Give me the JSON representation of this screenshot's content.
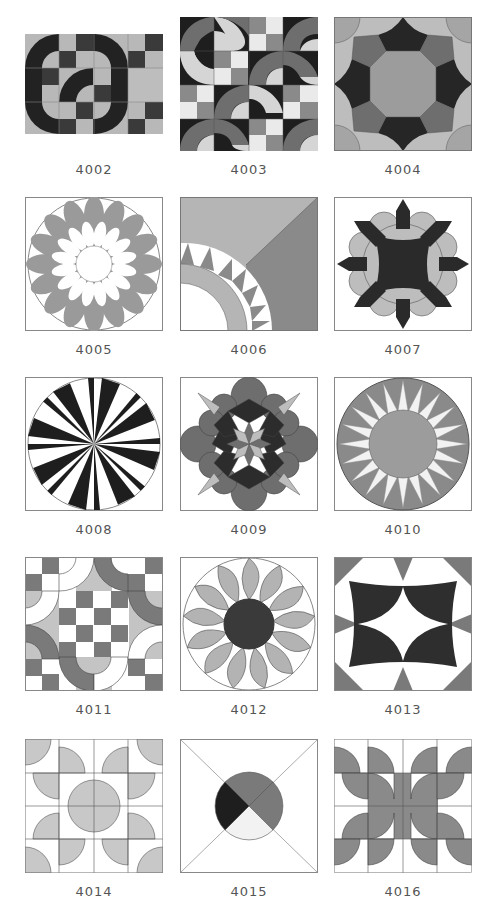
{
  "colors": {
    "black": "#222222",
    "dark": "#3a3a3a",
    "mid": "#7d7d7d",
    "gray": "#9a9a9a",
    "light": "#bdbdbd",
    "pale": "#e6e6e6",
    "white": "#ffffff",
    "outline": "#6a6a6a"
  },
  "blocks": [
    {
      "id": "4002",
      "label": "4002",
      "pattern": "curved-chain-checkerboard"
    },
    {
      "id": "4003",
      "label": "4003",
      "pattern": "wave-s-curves"
    },
    {
      "id": "4004",
      "label": "4004",
      "pattern": "octagon-star-arcs"
    },
    {
      "id": "4005",
      "label": "4005",
      "pattern": "double-petal-dahlia"
    },
    {
      "id": "4006",
      "label": "4006",
      "pattern": "quarter-sawtooth-fan"
    },
    {
      "id": "4007",
      "label": "4007",
      "pattern": "scalloped-arrow-medallion"
    },
    {
      "id": "4008",
      "label": "4008",
      "pattern": "mariners-compass-16"
    },
    {
      "id": "4009",
      "label": "4009",
      "pattern": "eight-point-star-petals"
    },
    {
      "id": "4010",
      "label": "4010",
      "pattern": "sunburst-circle"
    },
    {
      "id": "4011",
      "label": "4011",
      "pattern": "drunkards-path-checker"
    },
    {
      "id": "4012",
      "label": "4012",
      "pattern": "pinwheel-sunflower"
    },
    {
      "id": "4013",
      "label": "4013",
      "pattern": "concave-star-arcs"
    },
    {
      "id": "4014",
      "label": "4014",
      "pattern": "quarter-circle-grid"
    },
    {
      "id": "4015",
      "label": "4015",
      "pattern": "x-circle-quadrants"
    },
    {
      "id": "4016",
      "label": "4016",
      "pattern": "rotating-quarter-circles"
    }
  ]
}
